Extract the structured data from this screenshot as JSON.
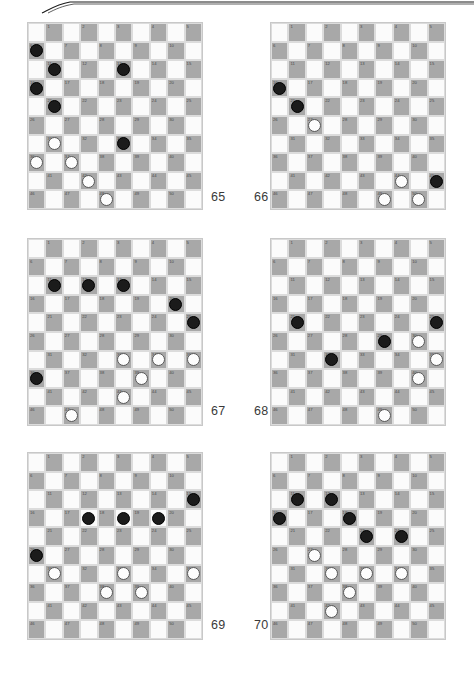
{
  "page": {
    "width": 474,
    "height": 675,
    "background": "#ffffff",
    "decoration": {
      "name": "top-swoosh-rule",
      "stroke_color": "#1a1a1a"
    }
  },
  "board_spec": {
    "rows": 10,
    "cols": 10,
    "numbering": "International draughts 1-50 on dark squares, left-to-right, top-to-bottom",
    "dark_color": "#a8a8a8",
    "light_color": "#fbfbfb",
    "black_piece_color": "#1b1b1b",
    "white_piece_color": "#fdfdfd"
  },
  "boards": [
    {
      "caption": "65",
      "caption_x": 211,
      "caption_y": 190,
      "x": 27,
      "y": 22,
      "black": [
        {
          "r": 1,
          "c": 0
        },
        {
          "r": 2,
          "c": 1
        },
        {
          "r": 2,
          "c": 5
        },
        {
          "r": 3,
          "c": 0
        },
        {
          "r": 4,
          "c": 1
        },
        {
          "r": 6,
          "c": 5
        }
      ],
      "white": [
        {
          "r": 6,
          "c": 1
        },
        {
          "r": 7,
          "c": 0
        },
        {
          "r": 7,
          "c": 2
        },
        {
          "r": 8,
          "c": 3
        },
        {
          "r": 9,
          "c": 4
        }
      ]
    },
    {
      "caption": "66",
      "caption_x": 254,
      "caption_y": 190,
      "x": 270,
      "y": 22,
      "black": [
        {
          "r": 3,
          "c": 0
        },
        {
          "r": 4,
          "c": 1
        },
        {
          "r": 8,
          "c": 9
        }
      ],
      "white": [
        {
          "r": 5,
          "c": 2
        },
        {
          "r": 8,
          "c": 7
        },
        {
          "r": 9,
          "c": 6
        },
        {
          "r": 9,
          "c": 8
        }
      ]
    },
    {
      "caption": "67",
      "caption_x": 211,
      "caption_y": 404,
      "x": 27,
      "y": 238,
      "black": [
        {
          "r": 2,
          "c": 1
        },
        {
          "r": 2,
          "c": 3
        },
        {
          "r": 2,
          "c": 5
        },
        {
          "r": 3,
          "c": 8
        },
        {
          "r": 4,
          "c": 9
        },
        {
          "r": 7,
          "c": 0
        }
      ],
      "white": [
        {
          "r": 6,
          "c": 5
        },
        {
          "r": 6,
          "c": 7
        },
        {
          "r": 6,
          "c": 9
        },
        {
          "r": 7,
          "c": 6
        },
        {
          "r": 8,
          "c": 5
        },
        {
          "r": 9,
          "c": 2
        }
      ]
    },
    {
      "caption": "68",
      "caption_x": 254,
      "caption_y": 404,
      "x": 270,
      "y": 238,
      "black": [
        {
          "r": 4,
          "c": 1
        },
        {
          "r": 4,
          "c": 9
        },
        {
          "r": 5,
          "c": 6
        },
        {
          "r": 6,
          "c": 3
        }
      ],
      "white": [
        {
          "r": 5,
          "c": 8
        },
        {
          "r": 6,
          "c": 9
        },
        {
          "r": 7,
          "c": 8
        },
        {
          "r": 9,
          "c": 6
        }
      ]
    },
    {
      "caption": "69",
      "caption_x": 211,
      "caption_y": 618,
      "x": 27,
      "y": 452,
      "black": [
        {
          "r": 2,
          "c": 9
        },
        {
          "r": 3,
          "c": 3
        },
        {
          "r": 3,
          "c": 5
        },
        {
          "r": 3,
          "c": 7
        },
        {
          "r": 5,
          "c": 0
        }
      ],
      "white": [
        {
          "r": 6,
          "c": 1
        },
        {
          "r": 6,
          "c": 5
        },
        {
          "r": 6,
          "c": 9
        },
        {
          "r": 7,
          "c": 4
        },
        {
          "r": 7,
          "c": 6
        }
      ]
    },
    {
      "caption": "70",
      "caption_x": 254,
      "caption_y": 618,
      "x": 270,
      "y": 452,
      "black": [
        {
          "r": 2,
          "c": 1
        },
        {
          "r": 2,
          "c": 3
        },
        {
          "r": 3,
          "c": 0
        },
        {
          "r": 3,
          "c": 4
        },
        {
          "r": 4,
          "c": 5
        },
        {
          "r": 4,
          "c": 7
        }
      ],
      "white": [
        {
          "r": 5,
          "c": 2
        },
        {
          "r": 6,
          "c": 3
        },
        {
          "r": 6,
          "c": 5
        },
        {
          "r": 6,
          "c": 7
        },
        {
          "r": 7,
          "c": 4
        },
        {
          "r": 8,
          "c": 3
        }
      ]
    }
  ]
}
